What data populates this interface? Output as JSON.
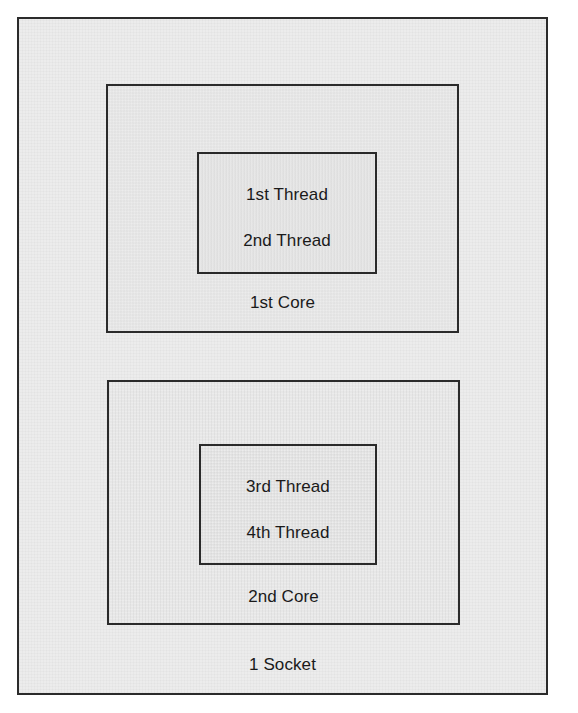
{
  "diagram": {
    "colors": {
      "page_background": "#ffffff",
      "box_fill": "#ececec",
      "box_border": "#2b2b2b",
      "text": "#1a1a1a"
    },
    "socket": {
      "label": "1 Socket",
      "cores": [
        {
          "label": "1st Core",
          "thread_group": {
            "threads": [
              {
                "label": "1st Thread"
              },
              {
                "label": "2nd Thread"
              }
            ]
          }
        },
        {
          "label": "2nd Core",
          "thread_group": {
            "threads": [
              {
                "label": "3rd Thread"
              },
              {
                "label": "4th Thread"
              }
            ]
          }
        }
      ]
    }
  }
}
